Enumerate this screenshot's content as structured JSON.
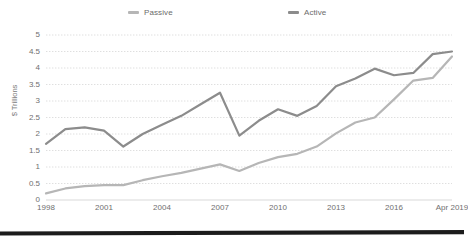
{
  "chart_data": {
    "type": "line",
    "title": "",
    "xlabel": "",
    "ylabel": "$ Trillions",
    "ylim": [
      0,
      5
    ],
    "yticks": [
      "0",
      "0.5",
      "1",
      "1.5",
      "2",
      "2.5",
      "3",
      "3.5",
      "4",
      "4.5",
      "5"
    ],
    "ytick_values": [
      0,
      0.5,
      1,
      1.5,
      2,
      2.5,
      3,
      3.5,
      4,
      4.5,
      5
    ],
    "xtick_labels": [
      "1998",
      "2001",
      "2004",
      "2007",
      "2010",
      "2013",
      "2016",
      "Apr 2019"
    ],
    "xtick_years": [
      1998,
      2001,
      2004,
      2007,
      2010,
      2013,
      2016,
      2019
    ],
    "xlim": [
      1998,
      2019
    ],
    "grid": "horizontal-dotted",
    "legend_position": "top-center",
    "x": [
      1998,
      1999,
      2000,
      2001,
      2002,
      2003,
      2004,
      2005,
      2006,
      2007,
      2008,
      2009,
      2010,
      2011,
      2012,
      2013,
      2014,
      2015,
      2016,
      2017,
      2018,
      2019
    ],
    "series": [
      {
        "name": "Passive",
        "color": "#b6b6b6",
        "values": [
          0.2,
          0.35,
          0.42,
          0.45,
          0.45,
          0.6,
          0.72,
          0.82,
          0.95,
          1.08,
          0.88,
          1.12,
          1.3,
          1.4,
          1.62,
          2.02,
          2.35,
          2.5,
          3.05,
          3.62,
          3.7,
          4.35
        ]
      },
      {
        "name": "Active",
        "color": "#8c8c8c",
        "values": [
          1.7,
          2.15,
          2.2,
          2.1,
          1.62,
          2.0,
          2.28,
          2.55,
          2.9,
          3.25,
          1.95,
          2.4,
          2.75,
          2.55,
          2.85,
          3.45,
          3.68,
          3.98,
          3.78,
          3.85,
          4.42,
          4.5
        ]
      }
    ]
  },
  "legend": {
    "passive_label": "Passive",
    "active_label": "Active",
    "passive_color": "#b6b6b6",
    "active_color": "#8c8c8c"
  },
  "axes": {
    "y_title": "$ Trillions"
  },
  "decor": {
    "bottom_bar_color": "#1c1c1c"
  }
}
